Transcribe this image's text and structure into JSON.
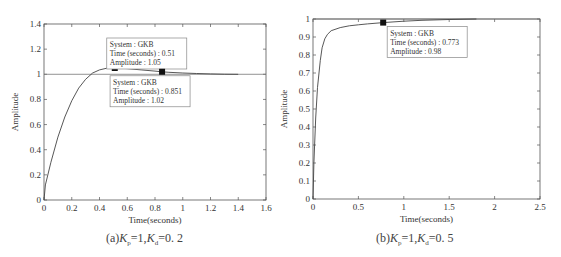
{
  "chart_data": [
    {
      "id": "a",
      "type": "line",
      "title": "",
      "caption": "(a)Kp=1,Kd=0.2",
      "caption_parts": {
        "prefix": "(a)",
        "k1": "K",
        "s1": "p",
        "v1": "=1,",
        "k2": "K",
        "s2": "d",
        "v2": "=0. 2"
      },
      "xlabel": "Time(seconds)",
      "ylabel": "Amplitude",
      "xlim": [
        0,
        1.6
      ],
      "ylim": [
        0,
        1.4
      ],
      "xticks": [
        "0",
        "0.2",
        "0.4",
        "0.6",
        "0.8",
        "1",
        "1.2",
        "1.4",
        "1.6"
      ],
      "yticks": [
        "0",
        "0.2",
        "0.4",
        "0.6",
        "0.8",
        "1",
        "1.2",
        "1.4"
      ],
      "grid": false,
      "reference_line": 1.0,
      "series": [
        {
          "name": "GKB",
          "x": [
            0,
            0.01,
            0.05,
            0.1,
            0.15,
            0.2,
            0.25,
            0.3,
            0.35,
            0.4,
            0.45,
            0.51,
            0.6,
            0.7,
            0.8,
            0.851,
            0.9,
            1.0,
            1.1,
            1.2,
            1.3,
            1.4
          ],
          "y": [
            0,
            0.12,
            0.3,
            0.5,
            0.66,
            0.79,
            0.89,
            0.96,
            1.01,
            1.035,
            1.048,
            1.05,
            1.045,
            1.035,
            1.025,
            1.02,
            1.016,
            1.01,
            1.006,
            1.003,
            1.001,
            1.0
          ]
        }
      ],
      "annotations": [
        {
          "x": 0.51,
          "y": 1.05,
          "lines": [
            "System : GKB",
            "Time (seconds) : 0.51",
            "Amplitude : 1.05"
          ]
        },
        {
          "x": 0.851,
          "y": 1.02,
          "lines": [
            "System : GKB",
            "Time (seconds) : 0.851",
            "Amplitude : 1.02"
          ]
        }
      ]
    },
    {
      "id": "b",
      "type": "line",
      "title": "",
      "caption": "(b)Kp=1,Kd=0.5",
      "caption_parts": {
        "prefix": "(b)",
        "k1": "K",
        "s1": "p",
        "v1": "=1,",
        "k2": "K",
        "s2": "d",
        "v2": "=0. 5"
      },
      "xlabel": "Time(seconds)",
      "ylabel": "Amplitude",
      "xlim": [
        0,
        2.5
      ],
      "ylim": [
        0,
        1.0
      ],
      "xticks": [
        "0",
        "0.5",
        "1",
        "1.5",
        "2",
        "2.5"
      ],
      "yticks": [
        "0",
        "0.1",
        "0.2",
        "0.3",
        "0.4",
        "0.5",
        "0.6",
        "0.7",
        "0.8",
        "0.9",
        "1"
      ],
      "grid": false,
      "reference_line": 1.0,
      "series": [
        {
          "name": "GKB",
          "x": [
            0,
            0.01,
            0.03,
            0.05,
            0.08,
            0.1,
            0.13,
            0.16,
            0.2,
            0.3,
            0.4,
            0.5,
            0.6,
            0.773,
            1.0,
            1.2,
            1.5,
            1.8
          ],
          "y": [
            0,
            0.2,
            0.45,
            0.62,
            0.77,
            0.84,
            0.89,
            0.915,
            0.935,
            0.952,
            0.962,
            0.968,
            0.973,
            0.98,
            0.988,
            0.993,
            0.997,
            1.0
          ]
        }
      ],
      "annotations": [
        {
          "x": 0.773,
          "y": 0.98,
          "lines": [
            "System : GKB",
            "Time (seconds) : 0.773",
            "Amplitude : 0.98"
          ]
        }
      ]
    }
  ],
  "colors": {
    "axis": "#555555",
    "curve": "#444444",
    "reference": "#777777",
    "marker": "#111111",
    "annotation_border": "#888888",
    "annotation_bg": "#ffffff"
  }
}
